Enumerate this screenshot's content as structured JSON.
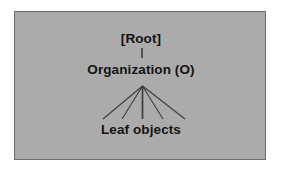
{
  "figure": {
    "panel": {
      "background_color": "#ababab",
      "border_color": "#6e6e6e",
      "outer_background_color": "#ffffff"
    },
    "line_color": "#3c3c3c",
    "text_color": "#141414"
  },
  "diagram": {
    "type": "tree",
    "nodes": [
      {
        "id": "root",
        "label": "[Root]",
        "level": 0
      },
      {
        "id": "organization",
        "label": "Organization (O)",
        "level": 1
      },
      {
        "id": "leaf",
        "label": "Leaf objects",
        "level": 2
      }
    ],
    "edges": [
      {
        "from": "root",
        "to": "organization",
        "style": "vertical"
      },
      {
        "from": "organization",
        "to": "leaf",
        "style": "fan",
        "branches": 5
      }
    ]
  }
}
